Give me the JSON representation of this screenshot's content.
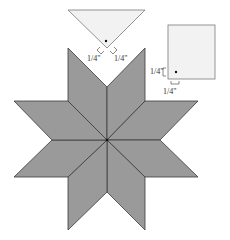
{
  "diagram": {
    "colors": {
      "diamond_fill": "#9a9a9a",
      "diamond_stroke": "#3a3a3a",
      "template_fill": "#f2f2f2",
      "template_stroke": "#7a7a7a",
      "background": "#ffffff"
    },
    "triangle_template": {
      "labels": {
        "left": "1/4\"",
        "right": "1/4\""
      }
    },
    "square_template": {
      "labels": {
        "left": "1/4\"",
        "bottom": "1/4\""
      }
    },
    "star": {
      "points": 8,
      "center": "center-dot"
    }
  }
}
